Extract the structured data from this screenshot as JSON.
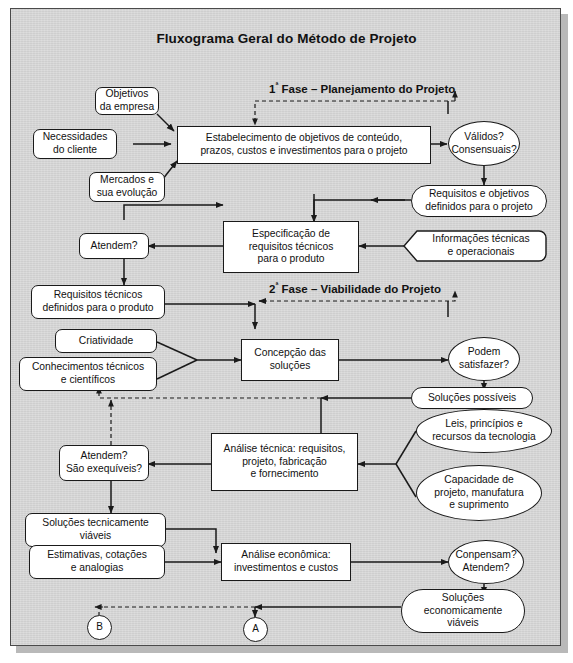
{
  "title": "Fluxograma Geral do Método de Projeto",
  "colors": {
    "panel_background": "#d3d3d3",
    "node_fill": "#ffffff",
    "stroke": "#1a1a1a",
    "frame_border": "#4a4a4a",
    "shadow": "#b9b9b9"
  },
  "phases": [
    {
      "id": "phase-1",
      "ordinal": "1",
      "ordinal_suffix": "ª",
      "label": " Fase – Planejamento do Projeto"
    },
    {
      "id": "phase-2",
      "ordinal": "2",
      "ordinal_suffix": "ª",
      "label": " Fase – Viabilidade do Projeto"
    }
  ],
  "nodes": [
    {
      "id": "objetivos-empresa",
      "shape": "round",
      "text": "Objetivos\nda empresa"
    },
    {
      "id": "necessidades-cliente",
      "shape": "round",
      "text": "Necessidades\ndo cliente"
    },
    {
      "id": "mercados-evolucao",
      "shape": "round",
      "text": "Mercados e\nsua evolução"
    },
    {
      "id": "estabelecimento-objetivos",
      "shape": "rect",
      "text": "Estabelecimento de objetivos de conteúdo,\nprazos, custos e investimentos para o projeto"
    },
    {
      "id": "validos-consensuais",
      "shape": "ellipse",
      "text": "Válidos?\nConsensuais?"
    },
    {
      "id": "requisitos-objetivos",
      "shape": "stadium",
      "text": "Requisitos e objetivos\ndefinidos para o projeto"
    },
    {
      "id": "informacoes-tecnicas",
      "shape": "pent",
      "text": "Informações técnicas\ne operacionais"
    },
    {
      "id": "especificacao-requisitos",
      "shape": "rect",
      "text": "Especificação de\nrequisitos técnicos\npara o produto"
    },
    {
      "id": "atendem",
      "shape": "round",
      "text": "Atendem?"
    },
    {
      "id": "requisitos-tecnicos",
      "shape": "round",
      "text": "Requisitos técnicos\ndefinidos para o produto"
    },
    {
      "id": "criatividade",
      "shape": "round",
      "text": "Criatividade"
    },
    {
      "id": "conhecimentos",
      "shape": "round",
      "text": "Conhecimentos técnicos\ne científicos"
    },
    {
      "id": "concepcao-solucoes",
      "shape": "rect",
      "text": "Concepção das\nsoluções"
    },
    {
      "id": "podem-satisfazer",
      "shape": "ellipse",
      "text": "Podem\nsatisfazer?"
    },
    {
      "id": "solucoes-possiveis",
      "shape": "stadium",
      "text": "Soluções possíveis"
    },
    {
      "id": "leis-principios",
      "shape": "ellipse",
      "text": "Leis, princípios e\nrecursos da tecnologia"
    },
    {
      "id": "capacidade-projeto",
      "shape": "ellipse",
      "text": "Capacidade de\nprojeto, manufatura\ne suprimento"
    },
    {
      "id": "analise-tecnica",
      "shape": "rect",
      "text": "Análise técnica: requisitos,\nprojeto, fabricação\ne fornecimento"
    },
    {
      "id": "atendem-exequiveis",
      "shape": "round",
      "text": "Atendem?\nSão exequíveis?"
    },
    {
      "id": "solucoes-tecnicamente",
      "shape": "round",
      "text": "Soluções tecnicamente\nviáveis"
    },
    {
      "id": "estimativas-cotacoes",
      "shape": "round",
      "text": "Estimativas, cotações\ne analogias"
    },
    {
      "id": "analise-economica",
      "shape": "rect",
      "text": "Análise econômica:\ninvestimentos e custos"
    },
    {
      "id": "conpensam-atendem",
      "shape": "ellipse",
      "text": "Conpensam?\nAtendem?"
    },
    {
      "id": "solucoes-economicamente",
      "shape": "stadium",
      "text": "Soluções\neconomicamente\nviáveis"
    },
    {
      "id": "connector-a",
      "shape": "circle",
      "text": "A"
    },
    {
      "id": "connector-b",
      "shape": "circle",
      "text": "B"
    }
  ]
}
